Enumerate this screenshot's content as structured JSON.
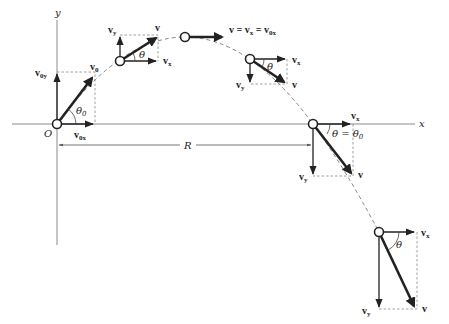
{
  "figure": {
    "axes": {
      "x_label": "x",
      "y_label": "y",
      "origin_label": "O"
    },
    "range_label": "R",
    "positions": [
      {
        "id": "launch",
        "labels": {
          "v": "v",
          "v_sub": "0",
          "vx": "v",
          "vx_sub": "0x",
          "vy": "v",
          "vy_sub": "0y",
          "angle": "θ",
          "angle_sub": "0"
        }
      },
      {
        "id": "rising",
        "labels": {
          "v": "v",
          "vx": "v",
          "vx_sub": "x",
          "vy": "v",
          "vy_sub": "y",
          "angle": "θ"
        }
      },
      {
        "id": "apex",
        "labels": {
          "equation": "v = v",
          "eq_sub1": "x",
          "eq_mid": " = v",
          "eq_sub2": "0x"
        }
      },
      {
        "id": "falling",
        "labels": {
          "v": "v",
          "vx": "v",
          "vx_sub": "x",
          "vy": "v",
          "vy_sub": "y",
          "angle": "θ"
        }
      },
      {
        "id": "landing",
        "labels": {
          "v": "v",
          "vx": "v",
          "vx_sub": "x",
          "vy": "v",
          "vy_sub": "y",
          "angle": "θ = θ",
          "angle_sub": "0"
        }
      },
      {
        "id": "below-launch",
        "labels": {
          "v": "v",
          "vx": "v",
          "vx_sub": "x",
          "vy": "v",
          "vy_sub": "y",
          "angle": "θ"
        }
      }
    ]
  }
}
